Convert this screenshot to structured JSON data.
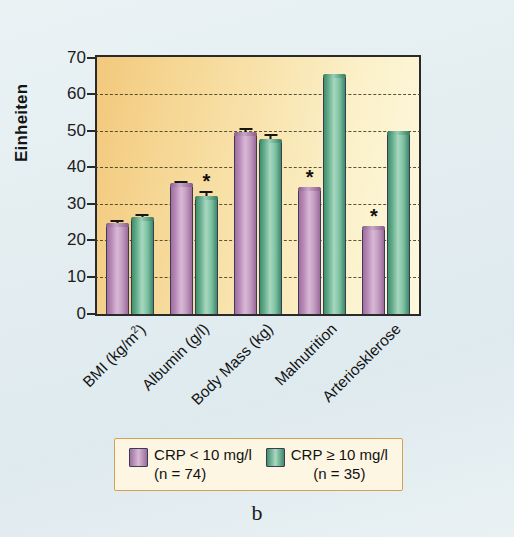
{
  "chart_data": {
    "type": "bar",
    "title": "",
    "xlabel": "",
    "ylabel": "Einheiten",
    "ylim": [
      0,
      70
    ],
    "ytick_step": 10,
    "yticks": [
      0,
      10,
      20,
      30,
      40,
      50,
      60,
      70
    ],
    "grid": true,
    "legend_position": "bottom",
    "categories": [
      "BMI (kg/m²)",
      "Albumin (g/l)",
      "Body Mass (kg)",
      "Malnutrition",
      "Arteriosklerose"
    ],
    "series": [
      {
        "name": "CRP < 10 mg/l",
        "n": 74,
        "color": "#b98ab8",
        "values": [
          24.7,
          35.6,
          49.5,
          34.7,
          23.8
        ],
        "errors": [
          0.9,
          0.7,
          1.3,
          0,
          0
        ],
        "significant": [
          false,
          false,
          false,
          true,
          true
        ]
      },
      {
        "name": "CRP ≥ 10 mg/l",
        "n": 35,
        "color": "#63ac8a",
        "values": [
          26.4,
          32.1,
          47.6,
          65.4,
          50.0
        ],
        "errors": [
          0.8,
          1.4,
          1.5,
          0,
          0
        ],
        "significant": [
          false,
          true,
          false,
          false,
          false
        ]
      }
    ],
    "annotations": [
      {
        "text": "*",
        "category": "Albumin (g/l)",
        "series": "CRP ≥ 10 mg/l"
      },
      {
        "text": "*",
        "category": "Malnutrition",
        "series": "CRP < 10 mg/l"
      },
      {
        "text": "*",
        "category": "Arteriosklerose",
        "series": "CRP < 10 mg/l"
      }
    ]
  },
  "axis": {
    "y_title": "Einheiten",
    "ticks": [
      "70",
      "60",
      "50",
      "40",
      "30",
      "20",
      "10",
      "0"
    ]
  },
  "legend": {
    "entries": [
      {
        "label": "CRP < 10 mg/l",
        "sub": "(n = 74)",
        "swatch": "purple"
      },
      {
        "label": "CRP ≥ 10 mg/l",
        "sub": "(n = 35)",
        "swatch": "green"
      }
    ]
  },
  "caption": {
    "text": "b"
  }
}
